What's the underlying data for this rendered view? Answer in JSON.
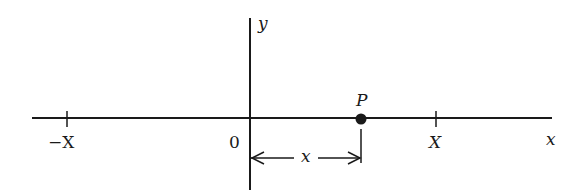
{
  "diagram": {
    "type": "number-line",
    "colors": {
      "line": "#1a1a1a",
      "background": "#ffffff"
    },
    "axes": {
      "x_label": "x",
      "y_label": "y",
      "origin_label": "0"
    },
    "ticks": [
      {
        "label": "−X",
        "position": "-X"
      },
      {
        "label": "X",
        "position": "X"
      }
    ],
    "point": {
      "label": "P",
      "description": "point at distance x from origin"
    },
    "measurement": {
      "label": "x",
      "from": "0",
      "to": "P"
    }
  }
}
